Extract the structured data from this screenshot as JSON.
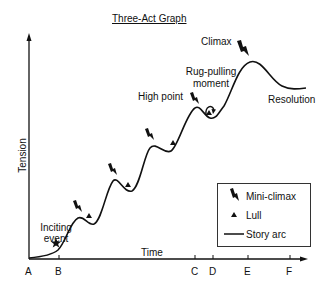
{
  "title": "Three-Act Graph",
  "axes": {
    "y_label": "Tension",
    "x_label": "Time",
    "x_ticks": [
      "A",
      "B",
      "C",
      "D",
      "E",
      "F"
    ]
  },
  "annotations": {
    "inciting_event": [
      "Inciting",
      "event"
    ],
    "high_point": "High point",
    "rug_pulling": [
      "Rug-pulling",
      "moment"
    ],
    "climax": "Climax",
    "resolution": "Resolution"
  },
  "legend": {
    "items": [
      {
        "symbol": "mini-climax-icon",
        "label": "Mini-climax"
      },
      {
        "symbol": "lull-icon",
        "label": "Lull"
      },
      {
        "symbol": "story-arc-line",
        "label": "Story arc"
      }
    ]
  },
  "colors": {
    "ink": "#111111",
    "background": "#ffffff"
  }
}
